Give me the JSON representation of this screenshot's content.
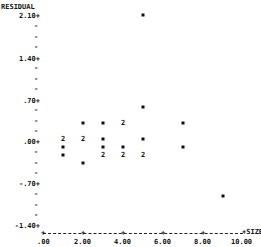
{
  "chart_data": {
    "type": "scatter",
    "title": "",
    "xlabel": "SIZE",
    "ylabel": "RESIDUAL",
    "xlim": [
      0,
      10
    ],
    "ylim": [
      -1.4,
      2.1
    ],
    "x_ticks": [
      ".00",
      "2.00",
      "4.00",
      "6.00",
      "8.00",
      "10.00"
    ],
    "y_ticks": [
      "2.10",
      "1.40",
      ".70",
      ".00",
      "-.70",
      "-1.40"
    ],
    "grid": false,
    "legend": null,
    "note": "Points marked '2' denote two coincident observations",
    "points": [
      {
        "x": 5,
        "y": 2.12,
        "count": 1
      },
      {
        "x": 5,
        "y": 0.59,
        "count": 1
      },
      {
        "x": 2,
        "y": 0.31,
        "count": 1
      },
      {
        "x": 3,
        "y": 0.31,
        "count": 1
      },
      {
        "x": 4,
        "y": 0.31,
        "count": 2
      },
      {
        "x": 7,
        "y": 0.31,
        "count": 1
      },
      {
        "x": 1,
        "y": 0.05,
        "count": 2
      },
      {
        "x": 2,
        "y": 0.05,
        "count": 2
      },
      {
        "x": 3,
        "y": 0.05,
        "count": 1
      },
      {
        "x": 5,
        "y": 0.05,
        "count": 1
      },
      {
        "x": 1,
        "y": -0.08,
        "count": 1
      },
      {
        "x": 3,
        "y": -0.08,
        "count": 1
      },
      {
        "x": 4,
        "y": -0.08,
        "count": 1
      },
      {
        "x": 7,
        "y": -0.08,
        "count": 1
      },
      {
        "x": 1,
        "y": -0.21,
        "count": 1
      },
      {
        "x": 3,
        "y": -0.21,
        "count": 2
      },
      {
        "x": 4,
        "y": -0.21,
        "count": 2
      },
      {
        "x": 5,
        "y": -0.21,
        "count": 2
      },
      {
        "x": 2,
        "y": -0.35,
        "count": 1
      },
      {
        "x": 9,
        "y": -0.9,
        "count": 1
      }
    ]
  },
  "labels": {
    "ylabel": "RESIDUAL",
    "xlabel": "+SIZE",
    "yticks": [
      "2.10+",
      "1.40+",
      ".70+",
      ".00+",
      "-.70+",
      "-1.40+"
    ],
    "xticks": [
      ".00",
      "2.00",
      "4.00",
      "6.00",
      "8.00",
      "10.00"
    ],
    "multi_marker": "2",
    "single_marker": "*"
  }
}
